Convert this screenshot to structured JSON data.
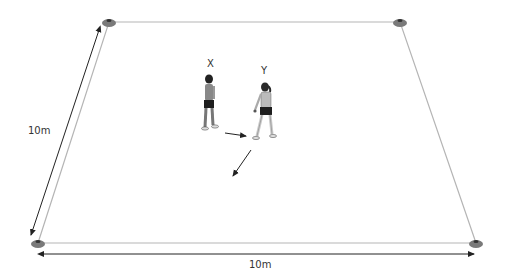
{
  "diagram": {
    "type": "sports-drill-field",
    "field": {
      "corners": [
        {
          "name": "top-left",
          "x": 109,
          "y": 22
        },
        {
          "name": "top-right",
          "x": 400,
          "y": 22
        },
        {
          "name": "bottom-right",
          "x": 476,
          "y": 243
        },
        {
          "name": "bottom-left",
          "x": 38,
          "y": 243
        }
      ],
      "line_color": "#b5b5b5",
      "cone_color": "#7a7a7a"
    },
    "dimensions": {
      "width_label": "10m",
      "depth_label": "10m"
    },
    "players": [
      {
        "id": "X",
        "label": "X",
        "x": 210,
        "y": 68
      },
      {
        "id": "Y",
        "label": "Y",
        "x": 264,
        "y": 72
      }
    ],
    "arrows": [
      {
        "name": "pass-arrow",
        "from": [
          225,
          133
        ],
        "to": [
          247,
          136
        ]
      },
      {
        "name": "run-arrow",
        "from": [
          251,
          150
        ],
        "to": [
          232,
          177
        ]
      }
    ]
  }
}
